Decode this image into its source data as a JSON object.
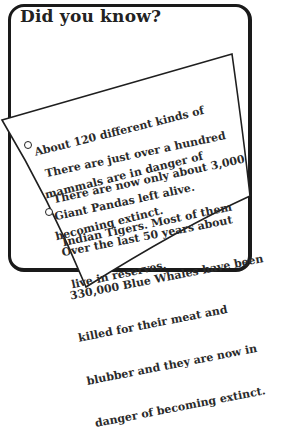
{
  "card": {
    "title": "Did you know?",
    "facts": [
      {
        "lines": [
          "About 120 different kinds of",
          "mammals are in danger of",
          "becoming extinct."
        ],
        "bullet": false
      },
      {
        "lines": [
          "There are just over a hundred",
          "Giant Pandas left alive."
        ],
        "bullet": true
      },
      {
        "lines": [
          "There are now only about 3,000",
          "Indian Tigers. Most of them",
          "live in reserves."
        ],
        "bullet": false
      },
      {
        "lines": [
          "Over the last 50 years about",
          "330,000 Blue Whales have been",
          "killed for their meat and",
          "blubber and they are now in",
          "danger of becoming extinct."
        ],
        "bullet": true
      }
    ]
  }
}
